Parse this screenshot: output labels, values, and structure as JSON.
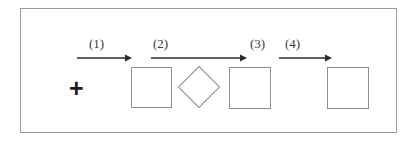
{
  "diagram": {
    "type": "reaction-sequence",
    "frame": {
      "x": 20,
      "y": 8,
      "width": 377,
      "height": 125,
      "border_color": "#9a9a9a"
    },
    "background_color": "#ffffff",
    "shape_stroke_color": "#8e8e8e",
    "arrow_color": "#2b2b2b",
    "label_color": "#3a3a3a",
    "plus": {
      "symbol": "+",
      "x": 68,
      "y": 75
    },
    "steps": [
      {
        "label": "(1)",
        "label_x": 88,
        "label_y": 36,
        "arrow_x": 76,
        "arrow_y": 56,
        "arrow_length": 54
      },
      {
        "label": "(2)",
        "label_x": 152,
        "label_y": 36,
        "arrow_x": 150,
        "arrow_y": 56,
        "arrow_length": 95
      },
      {
        "label": "(3)",
        "label_x": 249,
        "label_y": 36,
        "arrow_x": null,
        "arrow_y": null,
        "arrow_length": 0
      },
      {
        "label": "(4)",
        "label_x": 284,
        "label_y": 36,
        "arrow_x": 278,
        "arrow_y": 56,
        "arrow_length": 52
      }
    ],
    "shapes": [
      {
        "kind": "square",
        "x": 130,
        "y": 66,
        "size": 41
      },
      {
        "kind": "diamond",
        "x": 183,
        "y": 71,
        "size": 30
      },
      {
        "kind": "square",
        "x": 228,
        "y": 66,
        "size": 42
      },
      {
        "kind": "square",
        "x": 326,
        "y": 66,
        "size": 42
      }
    ]
  }
}
